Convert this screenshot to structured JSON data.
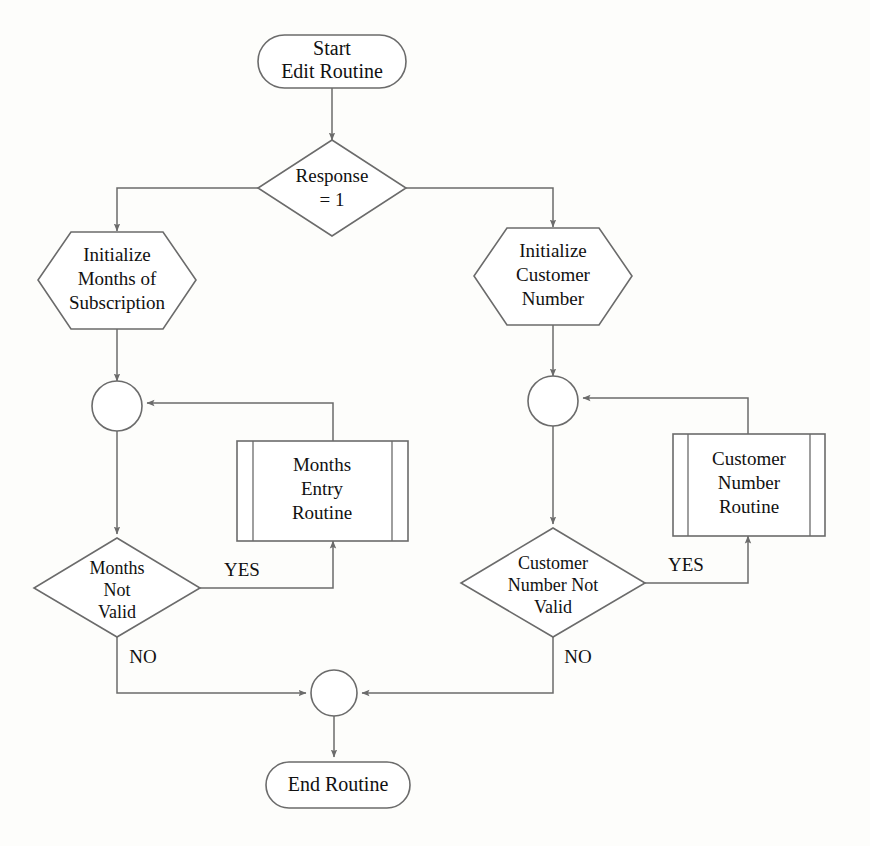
{
  "diagram": {
    "colors": {
      "stroke": "#6b6b6b",
      "text": "#111111",
      "background": "#fdfdfb",
      "shape_fill": "#ffffff"
    },
    "nodes": {
      "start": {
        "shape": "stadium",
        "line1": "Start",
        "line2": "Edit Routine"
      },
      "response_decision": {
        "shape": "diamond",
        "line1": "Response",
        "line2": "= 1"
      },
      "init_months": {
        "shape": "hexagon",
        "line1": "Initialize",
        "line2": "Months of",
        "line3": "Subscription"
      },
      "init_customer": {
        "shape": "hexagon",
        "line1": "Initialize",
        "line2": "Customer",
        "line3": "Number"
      },
      "months_junction": {
        "shape": "circle",
        "label": ""
      },
      "customer_junction": {
        "shape": "circle",
        "label": ""
      },
      "months_entry_routine": {
        "shape": "predefined-process",
        "line1": "Months",
        "line2": "Entry",
        "line3": "Routine"
      },
      "customer_number_routine": {
        "shape": "predefined-process",
        "line1": "Customer",
        "line2": "Number",
        "line3": "Routine"
      },
      "months_not_valid": {
        "shape": "diamond",
        "line1": "Months",
        "line2": "Not",
        "line3": "Valid"
      },
      "customer_number_not_valid": {
        "shape": "diamond",
        "line1": "Customer",
        "line2": "Number Not",
        "line3": "Valid"
      },
      "end_junction": {
        "shape": "circle",
        "label": ""
      },
      "end": {
        "shape": "stadium",
        "line1": "End Routine"
      }
    },
    "edge_labels": {
      "months_yes": "YES",
      "months_no": "NO",
      "customer_yes": "YES",
      "customer_no": "NO"
    }
  }
}
